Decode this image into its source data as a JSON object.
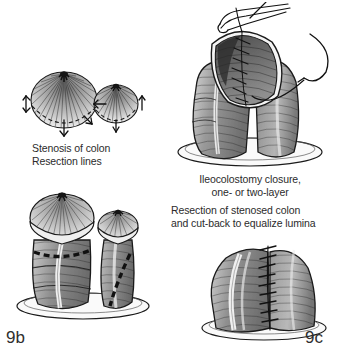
{
  "figure": {
    "background_color": "#ffffff",
    "ink_color": "#1b1b1b",
    "text_color": "#2b2b2b",
    "label_color": "#2f2f2f"
  },
  "captions": {
    "stenosis": "Stenosis of colon\nResection lines",
    "ileocolostomy": "Ileocolostomy closure,\none- or two-layer",
    "resection": "Resection of stenosed colon\nand cut-back to equalize lumina"
  },
  "labels": {
    "left": "9b",
    "right": "9c"
  },
  "illustrations": {
    "stenosis": "stenosis-of-colon-with-resection-lines-illustration",
    "closure": "ileocolostomy-closure-with-forceps-and-needle-illustration",
    "resection": "resected-bowel-segments-with-dashed-resection-lines-illustration",
    "completed": "completed-anastomosis-with-suture-line-illustration"
  }
}
